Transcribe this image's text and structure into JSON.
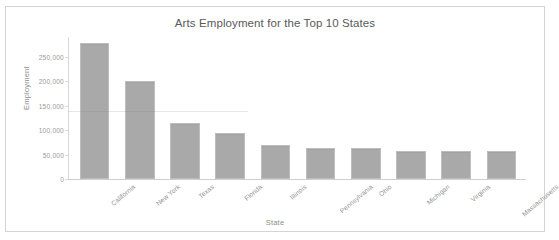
{
  "chart_data": {
    "type": "bar",
    "title": "Arts Employment for the Top 10 States",
    "xlabel": "State",
    "ylabel": "Employment",
    "categories": [
      "California",
      "New York",
      "Texas",
      "Florida",
      "Illinois",
      "Pennsylvania",
      "Ohio",
      "Michigan",
      "Virginia",
      "Massachusetts"
    ],
    "values": [
      277000,
      201000,
      114000,
      94000,
      70000,
      64000,
      63000,
      57000,
      57000,
      57000
    ],
    "ylim": [
      0,
      290000
    ],
    "ytick_values": [
      0,
      50000,
      100000,
      150000,
      200000,
      250000
    ],
    "ytick_labels": [
      "0",
      "50,000",
      "100,000",
      "150,000",
      "200,000",
      "250,000"
    ],
    "grid": false,
    "legend": null,
    "bar_color": "#a9a9a9",
    "bar_border_color": "#bdbdbd",
    "axis_color": "#d4d4d4",
    "text_color": "#8f8f8f",
    "title_color": "#58595b",
    "background": "#ffffff"
  }
}
